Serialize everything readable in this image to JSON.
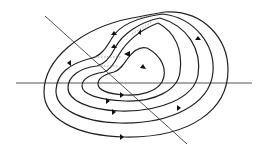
{
  "diagram": {
    "type": "phase-portrait",
    "colors": {
      "background": "#ffffff",
      "axis": "#555555",
      "orbit": "#222222",
      "dashed": "#888888",
      "arrow": "#111111"
    },
    "axes": [
      {
        "name": "horizontal-axis",
        "x1": 16,
        "y1": 83,
        "x2": 252,
        "y2": 83
      },
      {
        "name": "diagonal-axis",
        "x1": 45,
        "y1": 16,
        "x2": 187,
        "y2": 144
      }
    ],
    "orbit_count": 5,
    "has_dashed_segments": true,
    "labels": []
  }
}
